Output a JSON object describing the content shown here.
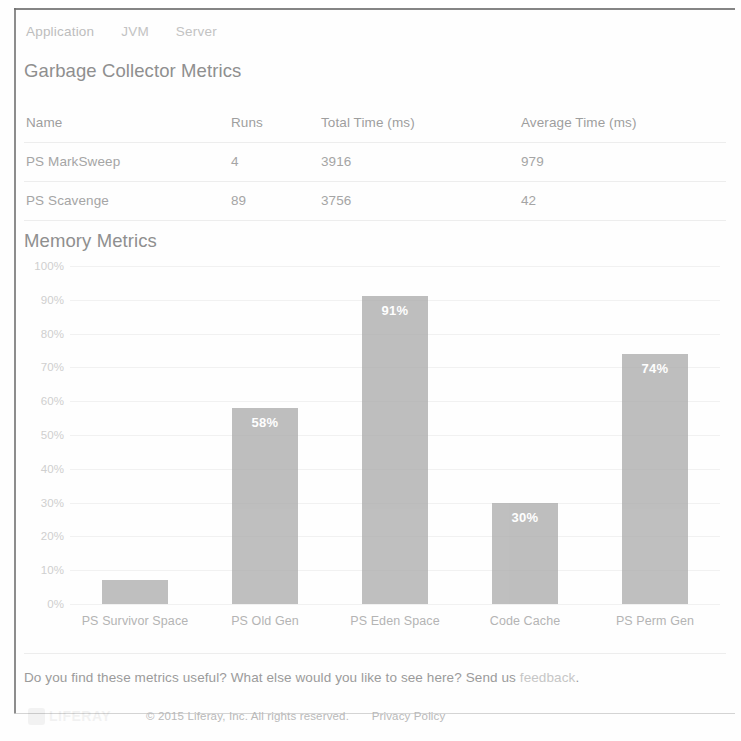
{
  "nav": {
    "tabs": [
      {
        "label": "Application"
      },
      {
        "label": "JVM"
      },
      {
        "label": "Server"
      }
    ]
  },
  "gc_section": {
    "title": "Garbage Collector Metrics",
    "columns": [
      "Name",
      "Runs",
      "Total Time (ms)",
      "Average Time (ms)"
    ],
    "rows": [
      {
        "name": "PS MarkSweep",
        "runs": "4",
        "total_time": "3916",
        "average_time": "979"
      },
      {
        "name": "PS Scavenge",
        "runs": "89",
        "total_time": "3756",
        "average_time": "42"
      }
    ]
  },
  "memory_section": {
    "title": "Memory Metrics"
  },
  "chart_data": {
    "type": "bar",
    "title": "Memory Metrics",
    "xlabel": "",
    "ylabel": "",
    "ylim": [
      0,
      100
    ],
    "grid": true,
    "legend": "none",
    "bar_color": "#adadad",
    "label_color": "#ffffff",
    "categories": [
      "PS Survivor Space",
      "PS Old Gen",
      "PS Eden Space",
      "Code Cache",
      "PS Perm Gen"
    ],
    "values": [
      7,
      58,
      91,
      30,
      74
    ],
    "value_labels": [
      "",
      "58%",
      "91%",
      "30%",
      "74%"
    ],
    "ticks": [
      "100%",
      "90%",
      "80%",
      "70%",
      "60%",
      "50%",
      "40%",
      "30%",
      "20%",
      "10%",
      "0%"
    ],
    "tick_values": [
      100,
      90,
      80,
      70,
      60,
      50,
      40,
      30,
      20,
      10,
      0
    ]
  },
  "feedback": {
    "text": "Do you find these metrics useful? What else would you like to see here? Send us ",
    "link": "feedback",
    "period": "."
  },
  "footer": {
    "logo_word": "LIFERAY",
    "copyright": "© 2015 Liferay, Inc. All rights reserved.",
    "privacy": "Privacy Policy"
  }
}
